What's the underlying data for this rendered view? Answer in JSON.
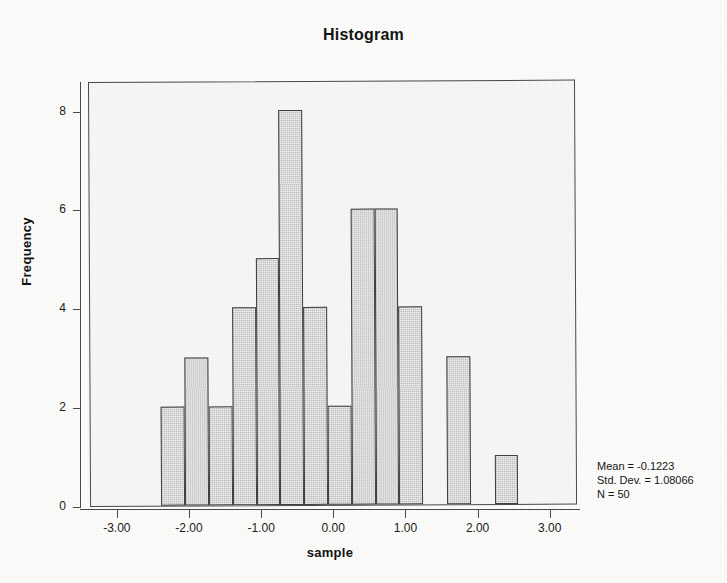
{
  "chart_data": {
    "type": "bar",
    "title": "Histogram",
    "xlabel": "sample",
    "ylabel": "Frequency",
    "xlim": [
      -3.4,
      3.35
    ],
    "ylim": [
      0,
      8.6
    ],
    "grid": false,
    "legend": null,
    "bin_width": 0.33,
    "categories": [
      "-2.26",
      "-1.93",
      "-1.60",
      "-1.27",
      "-0.94",
      "-0.61",
      "-0.28",
      "0.05",
      "0.38",
      "0.71",
      "1.04",
      "1.37",
      "1.70",
      "2.03",
      "2.36"
    ],
    "x": [
      -2.26,
      -1.93,
      -1.6,
      -1.27,
      -0.94,
      -0.61,
      -0.28,
      0.05,
      0.38,
      0.71,
      1.04,
      1.37,
      1.7,
      2.03,
      2.36
    ],
    "values": [
      2,
      3,
      2,
      4,
      5,
      8,
      4,
      2,
      6,
      6,
      4,
      0,
      3,
      0,
      1
    ],
    "xticks": [
      -3.0,
      -2.0,
      -1.0,
      0.0,
      1.0,
      2.0,
      3.0
    ],
    "xticklabels": [
      "-3.00",
      "-2.00",
      "-1.00",
      "0.00",
      "1.00",
      "2.00",
      "3.00"
    ],
    "yticks": [
      0,
      2,
      4,
      6,
      8
    ],
    "yticklabels": [
      "0",
      "2",
      "4",
      "6",
      "8"
    ],
    "bar_fill_color": "#c9c9c7",
    "bar_edge_color": "#3f3f3f",
    "plot_background_color": "#f6f6f5",
    "annotations": {
      "mean": "Mean = -0.1223",
      "std_dev": "Std. Dev. = 1.08066",
      "n": "N = 50"
    }
  },
  "chart": {
    "title": "Histogram",
    "xlabel": "sample",
    "ylabel": "Frequency"
  },
  "stats": {
    "mean": "Mean = -0.1223",
    "std_dev": "Std. Dev. = 1.08066",
    "n": "N = 50"
  }
}
